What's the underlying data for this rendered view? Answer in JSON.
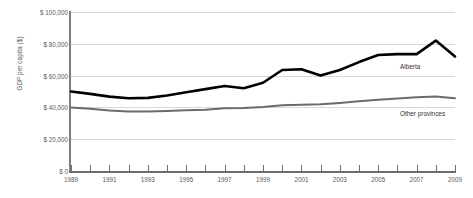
{
  "chart_data": {
    "type": "line",
    "title": "",
    "xlabel": "",
    "ylabel": "GDP per capita ($)",
    "x": [
      1989,
      1990,
      1991,
      1992,
      1993,
      1994,
      1995,
      1996,
      1997,
      1998,
      1999,
      2000,
      2001,
      2002,
      2003,
      2004,
      2005,
      2006,
      2007,
      2008,
      2009
    ],
    "xtick_labels": [
      "1989",
      "1991",
      "1993",
      "1995",
      "1997",
      "1999",
      "2001",
      "2003",
      "2005",
      "2007",
      "2009"
    ],
    "ytick_labels": [
      "$ 100,000",
      "$ 80,000",
      "$ 60,000",
      "$ 40,000",
      "$ 20,000",
      "$ 0"
    ],
    "ytick_values": [
      100000,
      80000,
      60000,
      40000,
      20000,
      0
    ],
    "ylim": [
      0,
      100000
    ],
    "xlim": [
      1989,
      2009
    ],
    "grid": true,
    "legend_position": "inline-right",
    "series": [
      {
        "name": "Alberta",
        "color": "#000000",
        "width": 2.6,
        "values": [
          50000,
          48500,
          46800,
          45800,
          46000,
          47500,
          49500,
          51500,
          53500,
          52000,
          55500,
          63500,
          64000,
          60000,
          63500,
          68500,
          73000,
          73500,
          73500,
          82000,
          72000
        ]
      },
      {
        "name": "Other provinces",
        "color": "#6b6b6b",
        "width": 2.0,
        "values": [
          40000,
          39200,
          38000,
          37400,
          37400,
          37800,
          38200,
          38600,
          39400,
          39600,
          40300,
          41400,
          41600,
          42000,
          42800,
          43800,
          44800,
          45600,
          46400,
          46800,
          45800
        ]
      }
    ]
  },
  "labels": {
    "alberta": "Alberta",
    "other_provinces": "Other provinces"
  },
  "colors": {
    "alberta": "#000000",
    "other_provinces": "#6b6b6b",
    "gridline": "#d8d8d8",
    "axis": "#6e6e6e",
    "text": "#5a5a5a",
    "background": "#ffffff"
  }
}
